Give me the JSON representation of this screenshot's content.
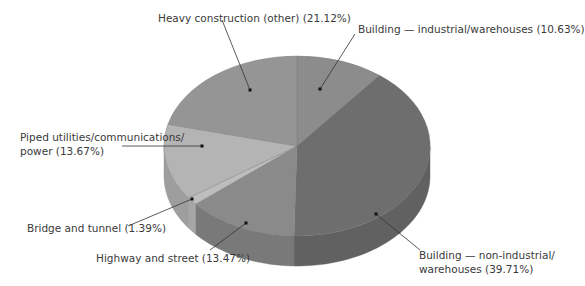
{
  "chart_data": {
    "type": "pie",
    "style": "3d",
    "title": "",
    "categories": [
      "Building — industrial/warehouses",
      "Building — non-industrial/warehouses",
      "Highway and street",
      "Bridge and tunnel",
      "Piped utilities/communications/power",
      "Heavy construction (other)"
    ],
    "values": [
      10.63,
      39.71,
      13.47,
      1.39,
      13.67,
      21.12
    ],
    "unit": "%",
    "legend": "none (callout labels)",
    "slice_colors": [
      "#8c8c8c",
      "#6e6e6e",
      "#8a8a8a",
      "#bdbdbd",
      "#b4b4b4",
      "#959595"
    ]
  },
  "labels": {
    "heavy": "Heavy construction (other) (21.12%)",
    "industrial": "Building — industrial/warehouses (10.63%)",
    "piped_line1": "Piped utilities/communications/",
    "piped_line2": "power (13.67%)",
    "bridge": "Bridge and tunnel (1.39%)",
    "highway": "Highway and street (13.47%)",
    "nonind_line1": "Building — non-industrial/",
    "nonind_line2": "warehouses (39.71%)"
  }
}
